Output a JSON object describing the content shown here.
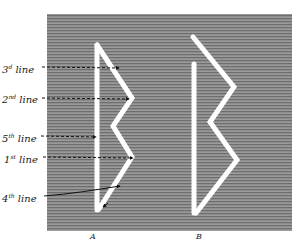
{
  "figure": {
    "background_color": "#ffffff",
    "panel": {
      "x": 47,
      "y": 14,
      "width": 245,
      "height": 217,
      "color": "#8c8c8c"
    },
    "shape_color": "#ffffff",
    "labels": [
      {
        "id": "third-line",
        "num": "3",
        "suffix": "d",
        "word": "line",
        "x": 2,
        "y": 62,
        "target": [
          119,
          68
        ]
      },
      {
        "id": "second-line",
        "num": "2",
        "suffix": "nd",
        "word": "line",
        "x": 2,
        "y": 92,
        "target": [
          129,
          98
        ]
      },
      {
        "id": "fifth-line",
        "num": "5",
        "suffix": "th",
        "word": "line",
        "x": 2,
        "y": 131,
        "target": [
          96,
          137
        ]
      },
      {
        "id": "first-line",
        "num": "1",
        "suffix": "st",
        "word": "line",
        "x": 4,
        "y": 152,
        "target": [
          133,
          158
        ]
      },
      {
        "id": "fourth-line",
        "num": "4",
        "suffix": "th",
        "word": "line",
        "x": 2,
        "y": 191,
        "target": [
          120,
          186
        ]
      }
    ],
    "captions": {
      "a": "A",
      "b": "B"
    }
  }
}
